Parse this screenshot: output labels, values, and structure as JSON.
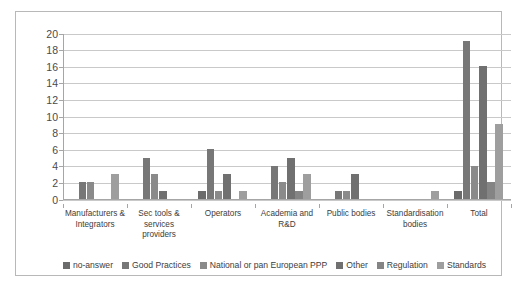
{
  "chart_data": {
    "type": "bar",
    "title": "",
    "subtitle": "",
    "xlabel": "",
    "ylabel": "",
    "ylim": [
      0,
      20
    ],
    "ytick_step": 2,
    "yticks": [
      "0",
      "2",
      "4",
      "6",
      "8",
      "10",
      "12",
      "14",
      "16",
      "18",
      "20"
    ],
    "grid": true,
    "legend_position": "bottom",
    "categories": [
      "Manufacturers & Integrators",
      "Sec tools & services providers",
      "Operators",
      "Academia and R&D",
      "Public bodies",
      "Standardisation bodies",
      "Total"
    ],
    "category_lines": [
      [
        "Manufacturers &",
        "Integrators"
      ],
      [
        "Sec tools &",
        "services",
        "providers"
      ],
      [
        "Operators"
      ],
      [
        "Academia and",
        "R&D"
      ],
      [
        "Public bodies"
      ],
      [
        "Standardisation",
        "bodies"
      ],
      [
        "Total"
      ]
    ],
    "series": [
      {
        "name": "no-answer",
        "color": "#6b6b6b",
        "values": [
          0,
          0,
          1,
          0,
          0,
          0,
          1
        ]
      },
      {
        "name": "Good Practices",
        "color": "#777777",
        "values": [
          2,
          5,
          6,
          4,
          1,
          0,
          19
        ]
      },
      {
        "name": "National or pan European PPP",
        "color": "#8a8a8a",
        "values": [
          2,
          3,
          1,
          2,
          1,
          0,
          4
        ]
      },
      {
        "name": "Other",
        "color": "#707070",
        "values": [
          0,
          1,
          3,
          5,
          3,
          0,
          16
        ]
      },
      {
        "name": "Regulation",
        "color": "#848484",
        "values": [
          0,
          0,
          0,
          1,
          0,
          0,
          2
        ]
      },
      {
        "name": "Standards",
        "color": "#9e9e9e",
        "values": [
          3,
          0,
          1,
          3,
          0,
          1,
          9
        ]
      }
    ]
  },
  "colors": {
    "frame_border": "#b8b8b8",
    "gridline": "#c9c9c9",
    "axis": "#a6a6a6",
    "text": "#3d3d3d",
    "background": "#ffffff"
  }
}
